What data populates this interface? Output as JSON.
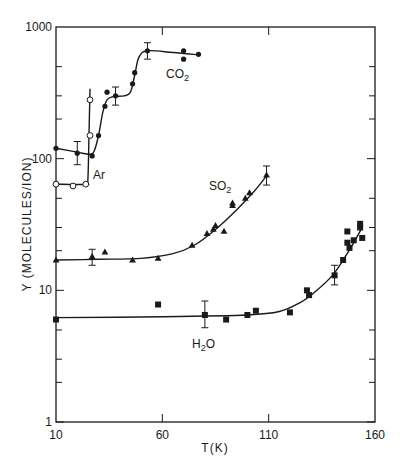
{
  "chart_data": {
    "type": "scatter",
    "title": "",
    "xlabel": "T(K)",
    "ylabel": "Y (MOLECULES/ION)",
    "xlim": [
      10,
      160
    ],
    "ylim": [
      1,
      1000
    ],
    "yscale": "log",
    "grid": false,
    "legend": "inline labels",
    "x_ticks": [
      "10",
      "60",
      "110",
      "160"
    ],
    "y_ticks": [
      "1",
      "10",
      "100",
      "1000"
    ],
    "series": [
      {
        "name": "CO2",
        "label_main": "CO",
        "label_sub": "2",
        "marker": "filled-circle",
        "points": [
          [
            10,
            120
          ],
          [
            20,
            110
          ],
          [
            27,
            105
          ],
          [
            30,
            150
          ],
          [
            33,
            250
          ],
          [
            34,
            320
          ],
          [
            38,
            300
          ],
          [
            46,
            370
          ],
          [
            47,
            450
          ],
          [
            53,
            660
          ],
          [
            70,
            660
          ],
          [
            70,
            570
          ],
          [
            77,
            620
          ]
        ],
        "error_bars": [
          [
            20,
            90,
            135
          ],
          [
            38,
            255,
            350
          ],
          [
            53,
            570,
            760
          ]
        ],
        "curve": [
          [
            10,
            120
          ],
          [
            20,
            112
          ],
          [
            26,
            108
          ],
          [
            28,
            115
          ],
          [
            30,
            150
          ],
          [
            32,
            225
          ],
          [
            34,
            280
          ],
          [
            37,
            296
          ],
          [
            42,
            300
          ],
          [
            45,
            320
          ],
          [
            47,
            430
          ],
          [
            49,
            590
          ],
          [
            53,
            660
          ],
          [
            65,
            640
          ],
          [
            77,
            615
          ]
        ]
      },
      {
        "name": "Ar",
        "label_main": "Ar",
        "label_sub": "",
        "marker": "open-circle",
        "points": [
          [
            10,
            64
          ],
          [
            18,
            62
          ],
          [
            24,
            64
          ],
          [
            26,
            150
          ],
          [
            26,
            280
          ]
        ],
        "error_bars": [],
        "curve": [
          [
            10,
            64
          ],
          [
            24,
            64
          ],
          [
            25,
            70
          ],
          [
            25.5,
            150
          ],
          [
            26,
            340
          ]
        ]
      },
      {
        "name": "SO2",
        "label_main": "SO",
        "label_sub": "2",
        "marker": "filled-triangle",
        "points": [
          [
            10,
            17
          ],
          [
            27,
            18
          ],
          [
            33,
            19.5
          ],
          [
            46,
            17
          ],
          [
            58,
            17.5
          ],
          [
            74,
            22
          ],
          [
            81,
            27
          ],
          [
            85,
            31
          ],
          [
            84,
            29
          ],
          [
            89,
            28
          ],
          [
            93,
            46
          ],
          [
            93,
            44
          ],
          [
            99,
            50
          ],
          [
            101,
            55
          ],
          [
            109,
            75
          ]
        ],
        "error_bars": [
          [
            27,
            15.5,
            20.5
          ],
          [
            109,
            63,
            88
          ]
        ],
        "curve": [
          [
            10,
            17
          ],
          [
            30,
            17.2
          ],
          [
            50,
            17.5
          ],
          [
            65,
            19
          ],
          [
            75,
            22
          ],
          [
            85,
            29
          ],
          [
            95,
            41
          ],
          [
            103,
            56
          ],
          [
            109,
            74
          ]
        ]
      },
      {
        "name": "H2O",
        "label_main": "H",
        "label_sub": "2",
        "label_tail": "O",
        "marker": "filled-square",
        "points": [
          [
            10,
            6
          ],
          [
            58,
            7.8
          ],
          [
            80,
            6.5
          ],
          [
            90,
            6
          ],
          [
            100,
            6.5
          ],
          [
            104,
            7
          ],
          [
            120,
            6.8
          ],
          [
            128,
            10
          ],
          [
            129,
            9.2
          ],
          [
            141,
            13
          ],
          [
            145,
            17
          ],
          [
            147,
            23
          ],
          [
            147,
            28
          ],
          [
            148,
            21
          ],
          [
            150,
            24
          ],
          [
            153,
            32
          ],
          [
            153,
            30
          ],
          [
            154,
            25
          ]
        ],
        "error_bars": [
          [
            80,
            5.2,
            8.3
          ],
          [
            141,
            11,
            15.5
          ]
        ],
        "curve": [
          [
            10,
            6.2
          ],
          [
            60,
            6.3
          ],
          [
            100,
            6.5
          ],
          [
            115,
            6.9
          ],
          [
            125,
            8.1
          ],
          [
            132,
            9.8
          ],
          [
            140,
            13
          ],
          [
            146,
            18
          ],
          [
            150,
            23
          ],
          [
            154,
            30
          ]
        ]
      }
    ]
  }
}
